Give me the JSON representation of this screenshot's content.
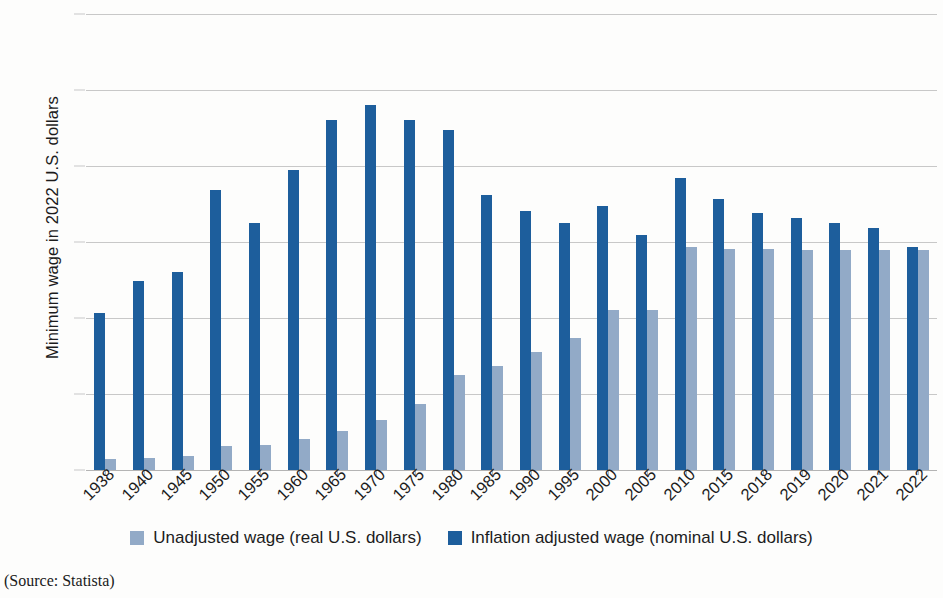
{
  "chart_data": {
    "type": "bar",
    "title": "",
    "xlabel": "",
    "ylabel": "Minimum wage in 2022 U.S. dollars",
    "ylim": [
      0,
      15
    ],
    "yticks": [
      15,
      12.5,
      10,
      7.5,
      5,
      2.5,
      0
    ],
    "ytick_labels": [
      "15",
      "12.5",
      "10",
      "7.5",
      "5",
      "2.5",
      "0"
    ],
    "grid": true,
    "legend_position": "bottom",
    "categories": [
      "1938",
      "1940",
      "1945",
      "1950",
      "1955",
      "1960",
      "1965",
      "1970",
      "1975",
      "1980",
      "1985",
      "1990",
      "1995",
      "2000",
      "2005",
      "2010",
      "2015",
      "2018",
      "2019",
      "2020",
      "2021",
      "2022"
    ],
    "series": [
      {
        "name": "Inflation adjusted wage (nominal U.S. dollars)",
        "color": "#1d5e9c",
        "values": [
          5.15,
          6.22,
          6.52,
          9.22,
          8.12,
          9.87,
          11.52,
          12.01,
          11.52,
          11.18,
          9.06,
          8.51,
          8.13,
          8.68,
          7.74,
          9.62,
          8.91,
          8.45,
          8.3,
          8.11,
          7.95,
          7.35
        ]
      },
      {
        "name": "Unadjusted wage (real U.S. dollars)",
        "color": "#92aac7",
        "values": [
          0.35,
          0.38,
          0.47,
          0.8,
          0.83,
          1.02,
          1.27,
          1.66,
          2.16,
          3.12,
          3.42,
          3.88,
          4.34,
          5.27,
          5.26,
          7.33,
          7.28,
          7.26,
          7.25,
          7.25,
          7.25,
          7.25
        ]
      }
    ],
    "source_note": "(Source: Statista)"
  },
  "legend": {
    "items": [
      {
        "label": "Unadjusted wage (real U.S. dollars)",
        "swatch": "light-blue-swatch"
      },
      {
        "label": "Inflation adjusted wage (nominal U.S. dollars)",
        "swatch": "dark-blue-swatch"
      }
    ]
  },
  "colors": {
    "dark_blue": "#1d5e9c",
    "light_blue": "#92aac7",
    "gridline": "#c8c8c8",
    "text": "#1c1c1c",
    "background": "#fdfdfc"
  }
}
